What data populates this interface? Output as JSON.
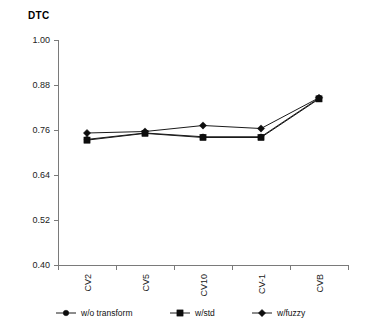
{
  "chart_data": {
    "type": "line",
    "title": "DTC",
    "xlabel": "",
    "ylabel": "",
    "categories": [
      "CV2",
      "CV5",
      "CV10",
      "CV-1",
      "CVB"
    ],
    "ylim": [
      0.4,
      1.0
    ],
    "yticks": [
      "0.40",
      "0.52",
      "0.64",
      "0.76",
      "0.88",
      "1.00"
    ],
    "ytick_values": [
      0.4,
      0.52,
      0.64,
      0.76,
      0.88,
      1.0
    ],
    "grid": false,
    "legend_position": "bottom",
    "series": [
      {
        "name": "w/o transform",
        "marker": "circle",
        "values": [
          0.735,
          0.752,
          0.742,
          0.742,
          0.845
        ]
      },
      {
        "name": "w/std",
        "marker": "square",
        "values": [
          0.733,
          0.751,
          0.74,
          0.74,
          0.843
        ]
      },
      {
        "name": "w/fuzzy",
        "marker": "diamond",
        "values": [
          0.752,
          0.756,
          0.772,
          0.764,
          0.846
        ]
      }
    ]
  },
  "legend": {
    "items": [
      {
        "label": "w/o transform",
        "marker": "circle"
      },
      {
        "label": "w/std",
        "marker": "square"
      },
      {
        "label": "w/fuzzy",
        "marker": "diamond"
      }
    ]
  },
  "colors": {
    "axis": "#7a7a7a",
    "series": "#1a1a1a",
    "text": "#000000",
    "background": "#ffffff"
  }
}
